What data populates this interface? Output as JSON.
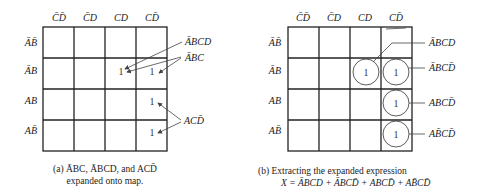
{
  "figure_a": {
    "col_labels": [
      "C̄D̄",
      "C̄D",
      "CD",
      "CD̄"
    ],
    "row_labels": [
      "ĀB̄",
      "ĀB",
      "AB",
      "AB̄"
    ],
    "cells": [
      [
        "",
        "",
        "",
        ""
      ],
      [
        "",
        "",
        "1",
        "1"
      ],
      [
        "",
        "",
        "",
        "1"
      ],
      [
        "",
        "",
        "",
        "1"
      ]
    ],
    "annotations": [
      "ĀBCD",
      "ĀBC",
      "ACD̄"
    ],
    "caption_line1": "(a) ĀBC, ĀBCD, and ACD̄",
    "caption_line2": "expanded onto map."
  },
  "figure_b": {
    "col_labels": [
      "C̄D̄",
      "C̄D",
      "CD",
      "CD̄"
    ],
    "row_labels": [
      "ĀB̄",
      "ĀB",
      "AB",
      "AB̄"
    ],
    "cells": [
      [
        "",
        "",
        "",
        ""
      ],
      [
        "",
        "",
        "1",
        "1"
      ],
      [
        "",
        "",
        "",
        "1"
      ],
      [
        "",
        "",
        "",
        "1"
      ]
    ],
    "annotations": [
      "ĀBCD",
      "ĀBCD̄",
      "ABCD̄",
      "AB̄CD̄"
    ],
    "caption_line1": "(b) Extracting the expanded expression",
    "caption_line2": "X = ĀBCD + ĀBCD̄ + ABCD̄ + AB̄CD̄"
  }
}
